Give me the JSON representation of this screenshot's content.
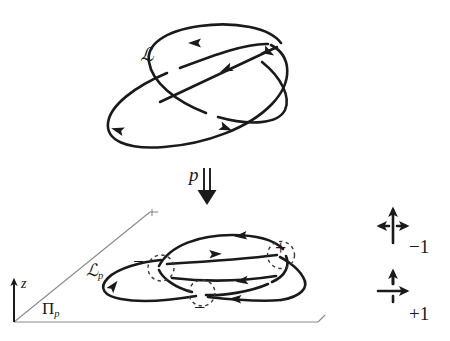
{
  "figure": {
    "kind": "knot-theory-link-projection-diagram",
    "background_color": "#ffffff",
    "ink_color": "#1a1a1a",
    "thin_line_color": "#8a8a8a"
  },
  "upper_diagram": {
    "name": "spatial-link",
    "label": "ℒ",
    "description": "two oriented interlocked ellipses forming a link in 3-space",
    "components": [
      {
        "name": "ellipse-back",
        "arrow_count": 2
      },
      {
        "name": "ellipse-front",
        "arrow_count": 3
      }
    ]
  },
  "projection": {
    "name": "projection-map",
    "label": "p",
    "arrow": "double-shaft-down-arrow"
  },
  "lower_diagram": {
    "name": "link-diagram",
    "label": "ℒ",
    "label_subscript": "p",
    "plane_label": "Π",
    "plane_label_subscript": "p",
    "axis_label": "z",
    "crossings": [
      {
        "name": "crossing-left",
        "sign": "−"
      },
      {
        "name": "crossing-right",
        "sign": "+"
      },
      {
        "name": "crossing-bottom",
        "sign": "−"
      }
    ]
  },
  "legend": {
    "name": "crossing-sign-legend",
    "entries": [
      {
        "name": "negative-crossing",
        "value": "−1",
        "over_strand": "vertical-up-arrow",
        "under_strand": "horizontal-right-arrow"
      },
      {
        "name": "positive-crossing",
        "value": "+1",
        "over_strand": "horizontal-right-arrow",
        "under_strand": "vertical-up-arrow"
      }
    ]
  }
}
